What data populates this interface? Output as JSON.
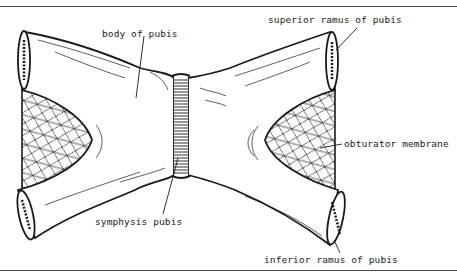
{
  "diagram": {
    "colors": {
      "ink": "#1a1a1a",
      "paper": "#ffffff",
      "rule": "#444444"
    },
    "labels": {
      "body_of_pubis": "body of pubis",
      "superior_ramus": "superior ramus of pubis",
      "obturator_membrane": "obturator membrane",
      "symphysis_pubis": "symphysis pubis",
      "inferior_ramus": "inferior ramus of pubis"
    }
  }
}
